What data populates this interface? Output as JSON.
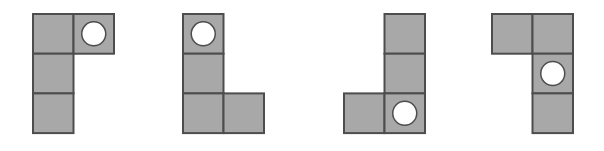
{
  "canvas": {
    "width": 604,
    "height": 151,
    "background": "#ffffff"
  },
  "style": {
    "cell_fill": "#a8a8a8",
    "cell_stroke": "#4d4d4d",
    "cell_stroke_width": 2,
    "circle_fill": "#ffffff",
    "circle_stroke": "#4d4d4d",
    "circle_stroke_width": 1.5,
    "cell_width": 40.5,
    "cell_height": 39.7,
    "circle_radius": 12
  },
  "figures": [
    {
      "id": "figure-1",
      "name": "l-shape-rotation-1",
      "origin_x": 33,
      "origin_y": 14,
      "cells": [
        {
          "col": 0,
          "row": 0,
          "circle": false
        },
        {
          "col": 1,
          "row": 0,
          "circle": true
        },
        {
          "col": 0,
          "row": 1,
          "circle": false
        },
        {
          "col": 0,
          "row": 2,
          "circle": false
        }
      ]
    },
    {
      "id": "figure-2",
      "name": "l-shape-rotation-2",
      "origin_x": 183,
      "origin_y": 14,
      "cells": [
        {
          "col": 0,
          "row": 0,
          "circle": true
        },
        {
          "col": 0,
          "row": 1,
          "circle": false
        },
        {
          "col": 0,
          "row": 2,
          "circle": false
        },
        {
          "col": 1,
          "row": 2,
          "circle": false
        }
      ]
    },
    {
      "id": "figure-3",
      "name": "l-shape-rotation-3",
      "origin_x": 344,
      "origin_y": 14,
      "cells": [
        {
          "col": 1,
          "row": 0,
          "circle": false
        },
        {
          "col": 1,
          "row": 1,
          "circle": false
        },
        {
          "col": 0,
          "row": 2,
          "circle": false
        },
        {
          "col": 1,
          "row": 2,
          "circle": true
        }
      ]
    },
    {
      "id": "figure-4",
      "name": "l-shape-rotation-4",
      "origin_x": 492,
      "origin_y": 14,
      "cells": [
        {
          "col": 0,
          "row": 0,
          "circle": false
        },
        {
          "col": 1,
          "row": 0,
          "circle": false
        },
        {
          "col": 1,
          "row": 1,
          "circle": true
        },
        {
          "col": 1,
          "row": 2,
          "circle": false
        }
      ]
    }
  ]
}
